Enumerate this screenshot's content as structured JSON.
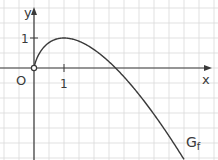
{
  "chart_data": {
    "type": "line",
    "title": "",
    "xlabel": "x",
    "ylabel": "y",
    "origin_label": "O",
    "curve_label": "G",
    "curve_label_sub": "f",
    "x_ticks": [
      {
        "value": 1,
        "label": "1"
      }
    ],
    "y_ticks": [
      {
        "value": 1,
        "label": "1"
      }
    ],
    "xlim": [
      -1.1,
      6.1
    ],
    "ylim": [
      -3.0,
      2.25
    ],
    "grid": true,
    "grid_step": 0.5,
    "series": [
      {
        "name": "G_f",
        "x": [
          0,
          0.1,
          0.25,
          0.5,
          0.75,
          1,
          1.5,
          2,
          2.5,
          2.718,
          3,
          3.5,
          4,
          4.5,
          5
        ],
        "y": [
          0,
          0.33,
          0.6,
          0.85,
          0.97,
          1.0,
          0.89,
          0.61,
          0.21,
          0.0,
          -0.3,
          -0.88,
          -1.55,
          -2.27,
          -3.05
        ]
      }
    ],
    "annotations": [
      "open circle at origin (0,0)"
    ]
  },
  "colors": {
    "grid": "#d9d9d9",
    "axis": "#3a3a3a",
    "curve": "#3a3a3a"
  }
}
